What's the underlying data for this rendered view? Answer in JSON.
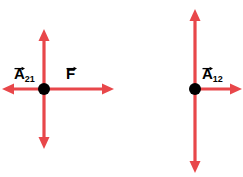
{
  "figure": {
    "type": "physics-vector-diagram",
    "background_color": "#ffffff",
    "vector_color": "#e8474a",
    "vector_color_light": "#f08a8c",
    "point_color": "#000000",
    "label_color": "#000000",
    "diagrams": [
      {
        "name": "left-diagram",
        "point": {
          "x": 44,
          "y": 89,
          "radius": 6
        },
        "arrows": [
          {
            "name": "arrow-left-horizontal-negative",
            "direction": "left",
            "from": {
              "x": 44,
              "y": 89
            },
            "to": {
              "x": 3,
              "y": 89
            },
            "head": "arrowhead-left"
          },
          {
            "name": "arrow-left-horizontal-positive",
            "direction": "right",
            "from": {
              "x": 44,
              "y": 89
            },
            "to": {
              "x": 113,
              "y": 89
            },
            "head": "arrowhead-right"
          },
          {
            "name": "arrow-left-vertical-up",
            "direction": "up",
            "from": {
              "x": 44,
              "y": 89
            },
            "to": {
              "x": 44,
              "y": 31
            },
            "head": "arrowhead-up"
          },
          {
            "name": "arrow-left-vertical-down",
            "direction": "down",
            "from": {
              "x": 44,
              "y": 89
            },
            "to": {
              "x": 44,
              "y": 147
            },
            "head": "arrowhead-down"
          }
        ],
        "labels": [
          {
            "name": "label-a21",
            "base": "A",
            "subscript": "21",
            "has_vector_arrow": true
          },
          {
            "name": "label-f",
            "base": "F",
            "subscript": "",
            "has_vector_arrow": true
          }
        ]
      },
      {
        "name": "right-diagram",
        "point": {
          "x": 195,
          "y": 89,
          "radius": 6
        },
        "arrows": [
          {
            "name": "arrow-right-horizontal-positive",
            "direction": "right",
            "from": {
              "x": 195,
              "y": 89
            },
            "to": {
              "x": 241,
              "y": 89
            },
            "head": "arrowhead-right"
          },
          {
            "name": "arrow-right-vertical-up",
            "direction": "up",
            "from": {
              "x": 195,
              "y": 89
            },
            "to": {
              "x": 195,
              "y": 10
            },
            "head": "arrowhead-up"
          },
          {
            "name": "arrow-right-vertical-down",
            "direction": "down",
            "from": {
              "x": 195,
              "y": 89
            },
            "to": {
              "x": 195,
              "y": 172
            },
            "head": "arrowhead-down"
          }
        ],
        "labels": [
          {
            "name": "label-a12",
            "base": "A",
            "subscript": "12",
            "has_vector_arrow": true
          }
        ]
      }
    ]
  }
}
